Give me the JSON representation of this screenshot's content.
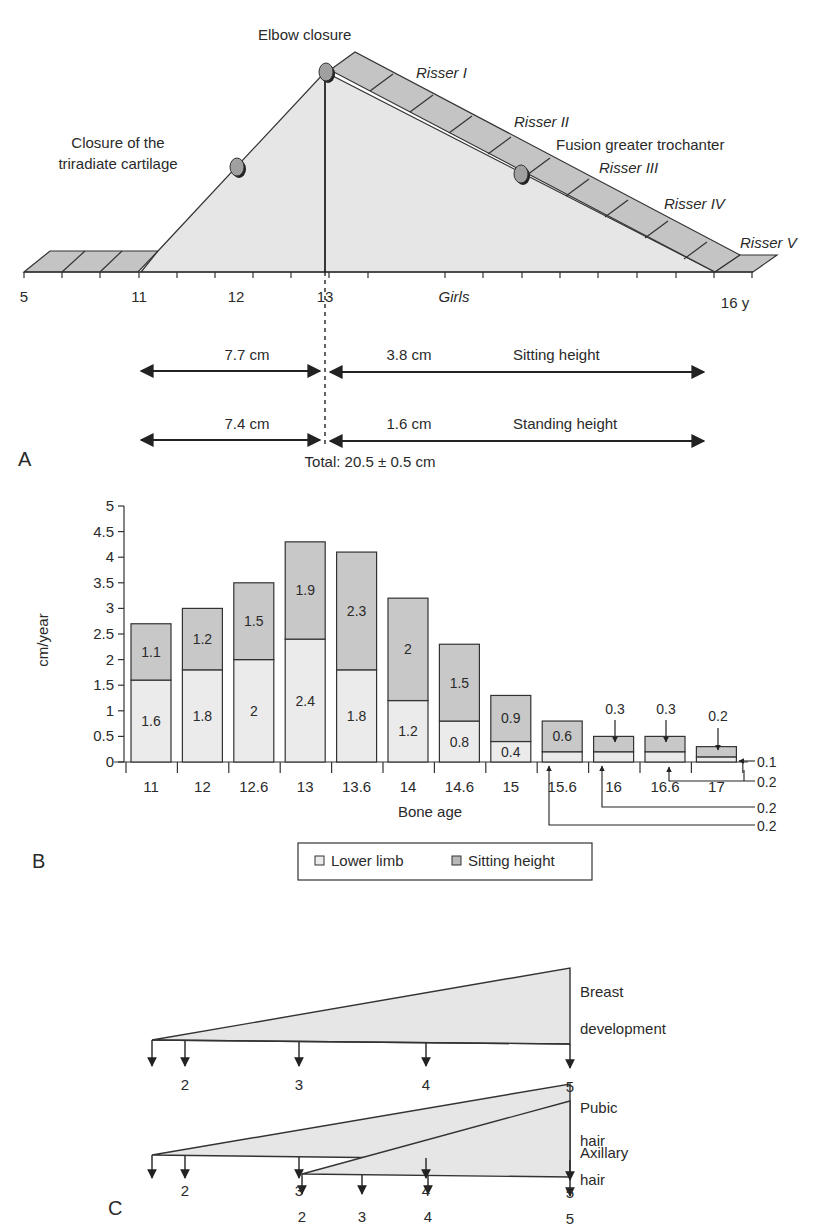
{
  "panels": {
    "A": {
      "label": "A",
      "sex_label": "Girls",
      "axis_ticks": [
        {
          "label": "5",
          "x": 24
        },
        {
          "label": "11",
          "x": 139
        },
        {
          "label": "12",
          "x": 236
        },
        {
          "label": "13",
          "x": 325
        },
        {
          "label": "16 y",
          "x": 735
        }
      ],
      "events": [
        {
          "label": "Closure of the",
          "label2": "triradiate cartilage",
          "age": 12
        },
        {
          "label": "Elbow closure",
          "age": 13
        },
        {
          "label": "Fusion greater trochanter",
          "age": 14.5
        }
      ],
      "risser_stages": [
        "Risser I",
        "Risser II",
        "Risser III",
        "Risser IV",
        "Risser V"
      ],
      "measurements": [
        {
          "before": "7.7 cm",
          "after": "3.8 cm",
          "label": "Sitting height"
        },
        {
          "before": "7.4 cm",
          "after": "1.6 cm",
          "label": "Standing height"
        }
      ],
      "total": "Total: 20.5 ± 0.5 cm",
      "colors": {
        "fill": "#e6e6e6",
        "band": "#c4c4c4",
        "node": "#9a9a9a",
        "stroke": "#333333"
      }
    },
    "B": {
      "label": "B",
      "legend": {
        "lower_limb": "Lower limb",
        "sitting_height": "Sitting height"
      },
      "callouts": {
        "top": [
          "0.3",
          "0.3",
          "0.2"
        ],
        "right": [
          "0.1",
          "0.2",
          "0.2",
          "0.2"
        ]
      }
    },
    "C": {
      "label": "C",
      "rows": [
        {
          "title1": "Breast",
          "title2": "development",
          "stages": [
            "",
            "2",
            "3",
            "4",
            "5"
          ]
        },
        {
          "title1": "Pubic",
          "title2": "hair",
          "stages": [
            "",
            "2",
            "3",
            "4",
            "5"
          ]
        },
        {
          "title1": "Axillary",
          "title2": "hair",
          "stages": [
            "2",
            "3",
            "4",
            "5"
          ]
        }
      ]
    }
  },
  "chart_data": [
    {
      "type": "bar",
      "stacked": true,
      "title": "",
      "xlabel": "Bone age",
      "ylabel": "cm/year",
      "ylim": [
        0,
        5
      ],
      "yticks": [
        "0",
        "0.5",
        "1",
        "1.5",
        "2",
        "2.5",
        "3",
        "3.5",
        "4",
        "4.5",
        "5"
      ],
      "categories": [
        "11",
        "12",
        "12.6",
        "13",
        "13.6",
        "14",
        "14.6",
        "15",
        "15.6",
        "16",
        "16.6",
        "17"
      ],
      "series": [
        {
          "name": "Lower limb",
          "color": "#ebebeb",
          "values": [
            1.6,
            1.8,
            2,
            2.4,
            1.8,
            1.2,
            0.8,
            0.4,
            0.2,
            0.2,
            0.2,
            0.1
          ]
        },
        {
          "name": "Sitting height",
          "color": "#c8c8c8",
          "values": [
            1.1,
            1.2,
            1.5,
            1.9,
            2.3,
            2,
            1.5,
            0.9,
            0.6,
            0.3,
            0.3,
            0.2
          ]
        }
      ],
      "legend_position": "bottom",
      "grid": false
    }
  ]
}
